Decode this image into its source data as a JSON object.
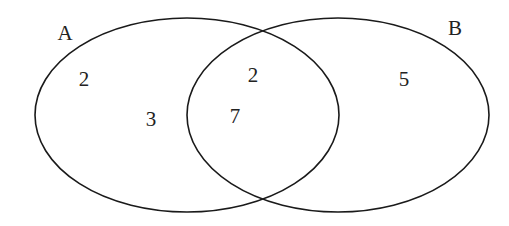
{
  "diagram": {
    "type": "venn",
    "sets": [
      {
        "id": "A",
        "label": "A",
        "ellipse": {
          "cx": 187,
          "cy": 115,
          "rx": 152,
          "ry": 97
        },
        "label_pos": {
          "x": 65,
          "y": 40
        }
      },
      {
        "id": "B",
        "label": "B",
        "ellipse": {
          "cx": 338,
          "cy": 115,
          "rx": 151,
          "ry": 97
        },
        "label_pos": {
          "x": 455,
          "y": 35
        }
      }
    ],
    "regions": [
      {
        "id": "a_only_1",
        "set": "A only",
        "value": "2",
        "pos": {
          "x": 84,
          "y": 86
        }
      },
      {
        "id": "a_only_2",
        "set": "A only",
        "value": "3",
        "pos": {
          "x": 151,
          "y": 126
        }
      },
      {
        "id": "a_and_b_1",
        "set": "A and B",
        "value": "2",
        "pos": {
          "x": 253,
          "y": 82
        }
      },
      {
        "id": "a_and_b_2",
        "set": "A and B",
        "value": "7",
        "pos": {
          "x": 235,
          "y": 123
        }
      },
      {
        "id": "b_only",
        "set": "B only",
        "value": "5",
        "pos": {
          "x": 404,
          "y": 86
        }
      }
    ],
    "stroke_color": "#1a1a1a",
    "text_color": "#222222",
    "background": "#ffffff"
  }
}
